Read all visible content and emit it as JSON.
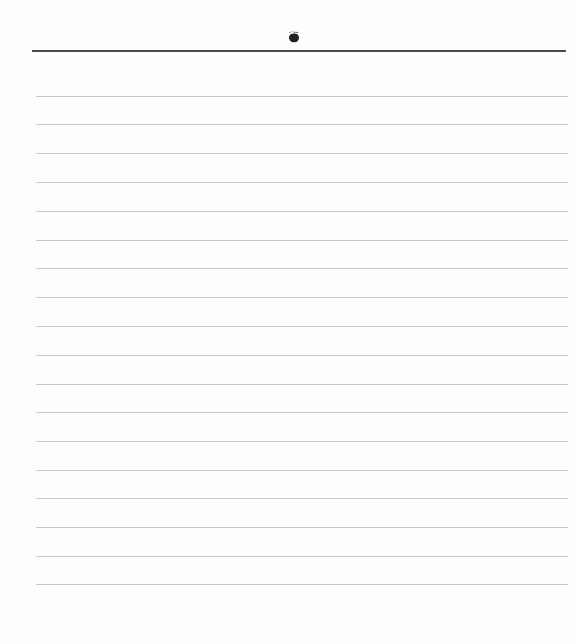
{
  "page": {
    "type": "lined-notepaper",
    "header": {
      "logo_icon": "apple-fruit-icon"
    },
    "colors": {
      "background": "#fdfdfd",
      "header_rule": "#4a4a4a",
      "ruled_line": "#c8c8c8",
      "logo": "#222222"
    },
    "ruled_line_count": 18,
    "ruled_lines_y": [
      96,
      124,
      153,
      182,
      211,
      240,
      268,
      297,
      326,
      355,
      384,
      412,
      441,
      470,
      498,
      527,
      556,
      584
    ]
  }
}
